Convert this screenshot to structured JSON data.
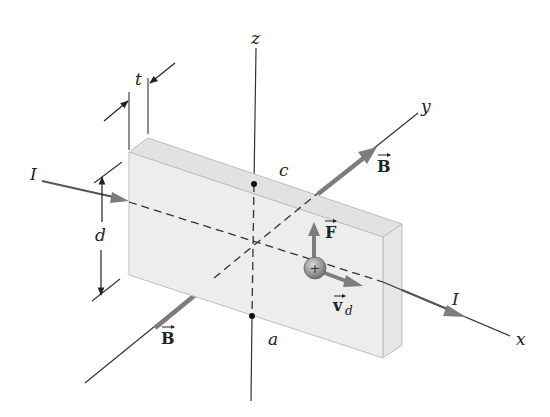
{
  "figure": {
    "colors": {
      "slab_front": "#ececec",
      "slab_top": "#e2e2e2",
      "slab_side": "#e6e6e6",
      "slab_edge": "#b9b9b9",
      "axis": "#333333",
      "vector_gray": "#7d7d7d",
      "charge_fill": "#9a9a9a",
      "point": "#111111"
    },
    "axes": {
      "x_label": "x",
      "y_label": "y",
      "z_label": "z"
    },
    "dimensions": {
      "thickness_label": "t",
      "height_label": "d"
    },
    "points": {
      "top_label": "c",
      "bottom_label": "a"
    },
    "current": {
      "in_label": "I",
      "out_label": "I"
    },
    "field": {
      "upper_label": "B",
      "lower_label": "B"
    },
    "charge": {
      "symbol": "+",
      "force_label": "F",
      "drift_label": "v",
      "drift_subscript": "d"
    }
  }
}
